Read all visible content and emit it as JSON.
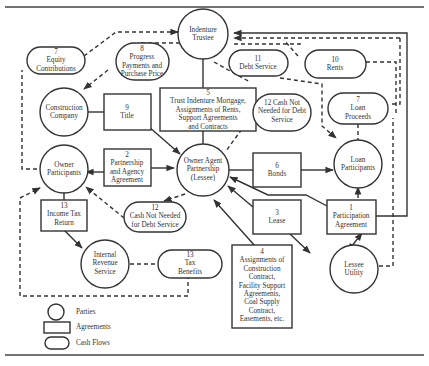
{
  "legend": {
    "parties": "Parties",
    "agreements": "Agreements",
    "cash_flows": "Cash Flows"
  },
  "parties": {
    "indenture_trustee": [
      "Indenture",
      "Trustee"
    ],
    "construction_company": [
      "Construction",
      "Company"
    ],
    "owner_participants": [
      "Owner",
      "Participants"
    ],
    "owner_agent": [
      "Owner Agent",
      "Partnership",
      "(Lessee)"
    ],
    "loan_participants": [
      "Loan",
      "Participants"
    ],
    "irs": [
      "Internal",
      "Revenue",
      "Service"
    ],
    "lessee_utility": [
      "Lessee",
      "Utility"
    ]
  },
  "agreements": {
    "a1": [
      "1",
      "Participation",
      "Agreement"
    ],
    "a2": [
      "2",
      "Partnership",
      "and Agency",
      "Agreement"
    ],
    "a3": [
      "3",
      "Lease"
    ],
    "a4": [
      "4",
      "Assignments of",
      "Construction",
      "Contract,",
      "Facility Support",
      "Agreements,",
      "Coal Supply",
      "Contract,",
      "Easements, etc."
    ],
    "a5": [
      "5",
      "Trust Indenture Mortgage,",
      "Assignments of Rents,",
      "Support Agreements",
      "and Contracts"
    ],
    "a6": [
      "6",
      "Bonds"
    ],
    "a9": [
      "9",
      "Title"
    ],
    "a13": [
      "13",
      "Income Tax",
      "Return"
    ]
  },
  "cash_flows": {
    "c7_equity": [
      "7",
      "Equity",
      "Contributions"
    ],
    "c8": [
      "8",
      "Progress",
      "Payments and",
      "Purchase Price"
    ],
    "c11": [
      "11",
      "Debt Service"
    ],
    "c10": [
      "10",
      "Rents"
    ],
    "c12_top": [
      "12 Cash Not",
      "Needed for Debt",
      "Service"
    ],
    "c7_loan": [
      "7",
      "Loan",
      "Proceeds"
    ],
    "c12_bottom": [
      "12",
      "Cash Not Needed",
      "for Debt Service"
    ],
    "c13": [
      "13",
      "Tax",
      "Benefits"
    ]
  }
}
